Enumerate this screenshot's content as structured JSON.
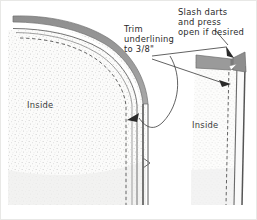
{
  "figure": {
    "background_color": "#fdfdfc",
    "ink_color": "#2a2a2a",
    "fabric_fill_color": "#f4f4f3",
    "stipple_color": "#b8b8b8",
    "facing_band_color": "#9a9a9a",
    "dart_color": "#8e8e8e"
  },
  "labels": {
    "trim": "Trim\nunderlining\nto 3/8\"",
    "slash": "Slash darts\nand press\nopen if desired",
    "inside_left": "Inside",
    "inside_right": "Inside"
  },
  "panels": [
    {
      "name": "left-garment-piece",
      "side_label": "Inside",
      "features": [
        "curved-neckline-edge",
        "trimmed-underlining-band",
        "stitching-line-dashed",
        "seam-allowance-edge"
      ]
    },
    {
      "name": "right-garment-piece",
      "side_label": "Inside",
      "features": [
        "slashed-dart",
        "dart-pressed-open",
        "stitching-line-dashed",
        "seam-allowance-edge"
      ]
    }
  ],
  "annotations": [
    {
      "name": "trim-underlining-callout",
      "text": "Trim\nunderlining\nto 3/8\"",
      "points_to": "left-garment-piece-edge"
    },
    {
      "name": "slash-darts-callout",
      "text": "Slash darts\nand press\nopen if desired",
      "points_to": "right-garment-piece-dart"
    }
  ]
}
